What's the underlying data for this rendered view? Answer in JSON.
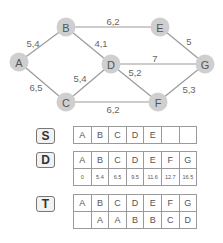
{
  "graph": {
    "nodes": [
      {
        "id": "A",
        "x": 19,
        "y": 62
      },
      {
        "id": "B",
        "x": 66,
        "y": 27
      },
      {
        "id": "C",
        "x": 66,
        "y": 102
      },
      {
        "id": "D",
        "x": 111,
        "y": 64
      },
      {
        "id": "E",
        "x": 160,
        "y": 27
      },
      {
        "id": "F",
        "x": 158,
        "y": 102
      },
      {
        "id": "G",
        "x": 205,
        "y": 64
      }
    ],
    "edges": [
      {
        "from": "A",
        "to": "B",
        "weight": "5,4",
        "lx": 33,
        "ly": 47
      },
      {
        "from": "A",
        "to": "C",
        "weight": "6,5",
        "lx": 36,
        "ly": 91
      },
      {
        "from": "B",
        "to": "E",
        "weight": "6,2",
        "lx": 113,
        "ly": 25
      },
      {
        "from": "B",
        "to": "D",
        "weight": "4,1",
        "lx": 101,
        "ly": 47
      },
      {
        "from": "C",
        "to": "D",
        "weight": "5,4",
        "lx": 80,
        "ly": 82
      },
      {
        "from": "D",
        "to": "G",
        "weight": "7",
        "lx": 155,
        "ly": 62
      },
      {
        "from": "D",
        "to": "F",
        "weight": "5,2",
        "lx": 135,
        "ly": 76
      },
      {
        "from": "C",
        "to": "F",
        "weight": "6,2",
        "lx": 113,
        "ly": 113
      },
      {
        "from": "E",
        "to": "G",
        "weight": "5",
        "lx": 189,
        "ly": 45
      },
      {
        "from": "F",
        "to": "G",
        "weight": "5,3",
        "lx": 189,
        "ly": 93
      }
    ]
  },
  "arrays": {
    "S": {
      "label": "S",
      "row": [
        "A",
        "B",
        "C",
        "D",
        "E",
        "",
        ""
      ]
    },
    "D": {
      "label": "D",
      "header": [
        "A",
        "B",
        "C",
        "D",
        "E",
        "F",
        "G"
      ],
      "values": [
        "0",
        "5.4",
        "6.5",
        "9.5",
        "11.6",
        "12.7",
        "16.5"
      ]
    },
    "T": {
      "label": "T",
      "header": [
        "A",
        "B",
        "C",
        "D",
        "E",
        "F",
        "G"
      ],
      "values": [
        "",
        "A",
        "A",
        "B",
        "B",
        "C",
        "D"
      ]
    }
  }
}
